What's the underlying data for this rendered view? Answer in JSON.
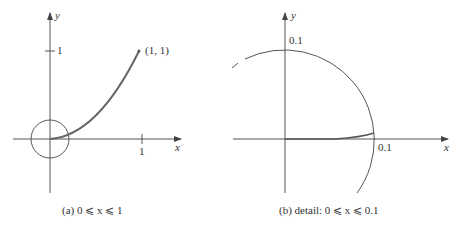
{
  "panel_a": {
    "axis_x_label": "x",
    "axis_y_label": "y",
    "tick_x": "1",
    "tick_y": "1",
    "point_label": "(1, 1)",
    "caption": "(a)  0 ⩽ x ⩽ 1"
  },
  "panel_b": {
    "axis_x_label": "x",
    "axis_y_label": "y",
    "tick_x": "0.1",
    "tick_y": "0.1",
    "caption": "(b)  detail:  0 ⩽ x ⩽ 0.1"
  }
}
